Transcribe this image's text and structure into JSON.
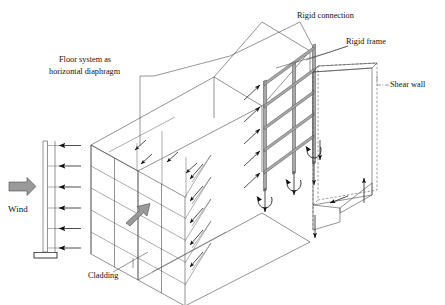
{
  "figure": {
    "width": 445,
    "height": 305,
    "background_color": "#ffffff",
    "line_color": "#4a4a4a",
    "accent_gray": "#9a9a9a",
    "text_color": "#111111"
  },
  "labels": {
    "wind": "Wind",
    "floor_system_line1": "Floor system as",
    "floor_system_line2": "horizontal diaphragm",
    "cladding": "Cladding",
    "rigid_connection": "Rigid connection",
    "rigid_frame": "Rigid frame",
    "shear_wall": "Shear  wall"
  },
  "wind_diagram": {
    "name": "wind-pressure-profile",
    "arrow_count": 6,
    "arrow_direction": "left",
    "load_type": "uniform-lateral-pressure",
    "support": "fixed-base-hatched",
    "column_top_y": 141,
    "column_bottom_y": 252
  },
  "building": {
    "storeys": 5,
    "facade_name": "cladding-facade",
    "diaphragm_planes": 6,
    "load_transfer_arrow": "gray-wind-transfer-arrow"
  },
  "rigid_frame": {
    "columns": 3,
    "beams": 5,
    "base_reactions": "moment-couples",
    "connection_type": "rigid"
  },
  "shear_wall": {
    "representation": "dashed-outline-panel",
    "base_reaction": "hatched-bearing-with-shear-and-uplift"
  }
}
